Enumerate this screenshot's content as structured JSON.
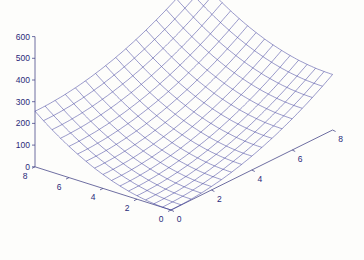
{
  "chart_data": {
    "type": "surface",
    "title": "",
    "xlabel": "",
    "ylabel": "",
    "zlabel": "",
    "x_range": [
      0,
      8
    ],
    "y_range": [
      0,
      8
    ],
    "z_range": [
      0,
      600
    ],
    "grid_step": 0.5,
    "function": "z = 4*(x^2 + y^2)",
    "x_ticks": [
      0,
      2,
      4,
      6,
      8
    ],
    "y_ticks": [
      0,
      2,
      4,
      6,
      8
    ],
    "z_ticks": [
      0,
      100,
      200,
      300,
      400,
      500,
      600
    ],
    "mesh_color": "#3a3a9a",
    "axis_color": "#4a4a8a",
    "label_color": "#2a2a7a",
    "corner_values": {
      "x0_y0": 0,
      "x8_y0": 256,
      "x0_y8": 256,
      "x8_y8": 512
    }
  },
  "projection": {
    "origin": [
      171,
      210
    ],
    "x_unit": [
      20.2,
      -10.0
    ],
    "y_unit": [
      -17.0,
      -5.4
    ],
    "z_unit_per_100": 21.7,
    "z_axis_x": 35
  }
}
